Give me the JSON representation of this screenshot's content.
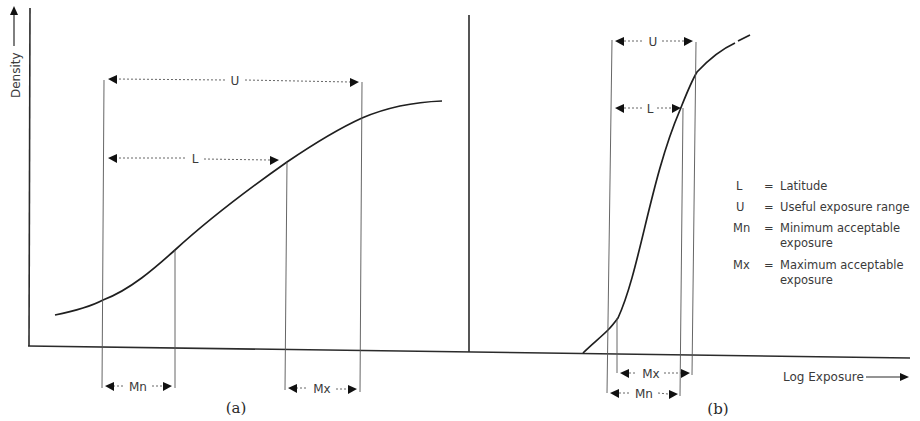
{
  "figure": {
    "y_axis_label": "Density",
    "x_axis_label": "Log Exposure",
    "panel_a": {
      "caption": "(a)",
      "range_labels": {
        "useful": "U",
        "latitude": "L",
        "minimum": "Mn",
        "maximum": "Mx"
      }
    },
    "panel_b": {
      "caption": "(b)",
      "range_labels": {
        "useful": "U",
        "latitude": "L",
        "minimum": "Mn",
        "maximum": "Mx"
      }
    },
    "legend": [
      {
        "symbol": "L",
        "eq": "=",
        "line1": "Latitude",
        "line2": ""
      },
      {
        "symbol": "U",
        "eq": "=",
        "line1": "Useful exposure range",
        "line2": ""
      },
      {
        "symbol": "Mn",
        "eq": "=",
        "line1": "Minimum acceptable",
        "line2": "exposure"
      },
      {
        "symbol": "Mx",
        "eq": "=",
        "line1": "Maximum acceptable",
        "line2": "exposure"
      }
    ],
    "colors": {
      "ink": "#1f1f1f",
      "background": "#ffffff"
    }
  }
}
